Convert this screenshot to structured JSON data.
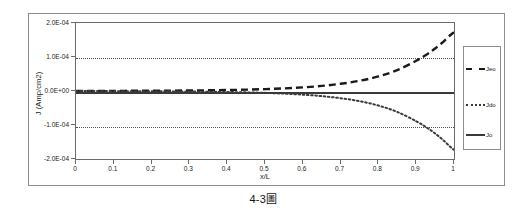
{
  "caption": {
    "number": "4-3",
    "cjk": "圖",
    "full": "4-3圖"
  },
  "chart_data": {
    "type": "line",
    "title": "",
    "xlabel": "x/L",
    "ylabel": "J (Amp/cm2)",
    "xlim": [
      0,
      1
    ],
    "ylim": [
      -0.0002,
      0.0002
    ],
    "grid": true,
    "legend_position": "right",
    "x_tick_labels": [
      "0",
      "0.1",
      "0.2",
      "0.3",
      "0.4",
      "0.5",
      "0.6",
      "0.7",
      "0.8",
      "0.9",
      "1"
    ],
    "x_ticks": [
      0,
      0.1,
      0.2,
      0.3,
      0.4,
      0.5,
      0.6,
      0.7,
      0.8,
      0.9,
      1
    ],
    "y_tick_labels": [
      "2.0E-04",
      "1.0E-04",
      "0.0E+00",
      "-1.0E-04",
      "-2.0E-04"
    ],
    "y_ticks": [
      0.0002,
      0.0001,
      0,
      -0.0001,
      -0.0002
    ],
    "gridlines_y": [
      0.0001,
      -0.0001
    ],
    "x": [
      0,
      0.05,
      0.1,
      0.15,
      0.2,
      0.25,
      0.3,
      0.35,
      0.4,
      0.45,
      0.5,
      0.55,
      0.6,
      0.65,
      0.7,
      0.75,
      0.8,
      0.85,
      0.9,
      0.93,
      0.95,
      0.97,
      0.99,
      1
    ],
    "series": [
      {
        "name": "Jeo",
        "style": "dashed",
        "color": "#1a1a1a",
        "values": [
          2e-07,
          3e-07,
          4e-07,
          6e-07,
          8e-07,
          1.1e-06,
          1.5e-06,
          2.1e-06,
          2.9e-06,
          4e-06,
          5.5e-06,
          7.7e-06,
          1.07e-05,
          1.5e-05,
          2.12e-05,
          3e-05,
          4.28e-05,
          6.16e-05,
          8.9e-05,
          0.000109,
          0.000125,
          0.000143,
          0.000164,
          0.000173
        ]
      },
      {
        "name": "Jdo",
        "style": "dotted",
        "color": "#3a3a3a",
        "values": [
          -2e-07,
          -3e-07,
          -4e-07,
          -6e-07,
          -8e-07,
          -1.1e-06,
          -1.5e-06,
          -2.1e-06,
          -2.9e-06,
          -4e-06,
          -5.5e-06,
          -7.7e-06,
          -1.07e-05,
          -1.5e-05,
          -2.12e-05,
          -3e-05,
          -4.28e-05,
          -6.16e-05,
          -8.9e-05,
          -0.000109,
          -0.000125,
          -0.000143,
          -0.000164,
          -0.000173
        ]
      },
      {
        "name": "Jo",
        "style": "solid",
        "color": "#3a3a3a",
        "values": [
          0,
          0,
          0,
          0,
          0,
          0,
          0,
          0,
          0,
          0,
          0,
          0,
          0,
          0,
          0,
          0,
          0,
          0,
          0,
          0,
          0,
          0,
          0,
          0
        ]
      }
    ]
  }
}
